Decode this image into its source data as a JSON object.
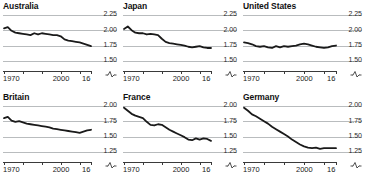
{
  "chart_data": {
    "type": "line",
    "title": "",
    "xlabel": "",
    "ylabel": "",
    "grid": true,
    "legend_position": "none",
    "x_axis": {
      "start": 1970,
      "end": 2016,
      "tick_labels": [
        "1970",
        "2000",
        "16"
      ],
      "tick_label_years": [
        1970,
        2000,
        2016
      ],
      "minor_tick_years": [
        1970,
        1980,
        1990,
        2000,
        2010,
        2016
      ],
      "axis_break_symbol": "~"
    },
    "panels": [
      {
        "title": "Australia",
        "ylim": [
          1.4,
          2.28
        ],
        "yticks": [
          2.25,
          2.0,
          1.75,
          1.5
        ],
        "ytick_labels": [
          "2.25",
          "2.00",
          "1.75",
          "1.50"
        ],
        "x": [
          1970,
          1972,
          1974,
          1976,
          1978,
          1980,
          1982,
          1984,
          1986,
          1988,
          1990,
          1992,
          1994,
          1996,
          1998,
          2000,
          2002,
          2004,
          2006,
          2008,
          2010,
          2012,
          2014,
          2016
        ],
        "values": [
          2.03,
          2.05,
          1.99,
          1.96,
          1.95,
          1.94,
          1.93,
          1.92,
          1.95,
          1.93,
          1.95,
          1.94,
          1.93,
          1.92,
          1.92,
          1.9,
          1.85,
          1.83,
          1.82,
          1.81,
          1.8,
          1.78,
          1.76,
          1.74
        ]
      },
      {
        "title": "Japan",
        "ylim": [
          1.4,
          2.28
        ],
        "yticks": [
          2.25,
          2.0,
          1.75,
          1.5
        ],
        "ytick_labels": [
          "2.25",
          "2.00",
          "1.75",
          "1.50"
        ],
        "x": [
          1970,
          1972,
          1974,
          1976,
          1978,
          1980,
          1982,
          1984,
          1986,
          1988,
          1990,
          1992,
          1994,
          1996,
          1998,
          2000,
          2002,
          2004,
          2006,
          2008,
          2010,
          2012,
          2014,
          2016
        ],
        "values": [
          2.02,
          2.06,
          2.0,
          1.96,
          1.95,
          1.95,
          1.93,
          1.94,
          1.93,
          1.92,
          1.86,
          1.81,
          1.79,
          1.78,
          1.77,
          1.76,
          1.75,
          1.73,
          1.72,
          1.73,
          1.74,
          1.72,
          1.71,
          1.71
        ]
      },
      {
        "title": "United States",
        "ylim": [
          1.4,
          2.28
        ],
        "yticks": [
          2.25,
          2.0,
          1.75,
          1.5
        ],
        "ytick_labels": [
          "2.25",
          "2.00",
          "1.75",
          "1.50"
        ],
        "x": [
          1970,
          1972,
          1974,
          1976,
          1978,
          1980,
          1982,
          1984,
          1986,
          1988,
          1990,
          1992,
          1994,
          1996,
          1998,
          2000,
          2002,
          2004,
          2006,
          2008,
          2010,
          2012,
          2014,
          2016
        ],
        "values": [
          1.8,
          1.79,
          1.77,
          1.74,
          1.73,
          1.74,
          1.72,
          1.71,
          1.74,
          1.72,
          1.74,
          1.73,
          1.74,
          1.75,
          1.77,
          1.78,
          1.77,
          1.75,
          1.73,
          1.72,
          1.71,
          1.72,
          1.74,
          1.75
        ]
      },
      {
        "title": "Britain",
        "ylim": [
          1.15,
          2.03
        ],
        "yticks": [
          2.0,
          1.75,
          1.5,
          1.25
        ],
        "ytick_labels": [
          "2.00",
          "1.75",
          "1.50",
          "1.25"
        ],
        "x": [
          1970,
          1972,
          1974,
          1976,
          1978,
          1980,
          1982,
          1984,
          1986,
          1988,
          1990,
          1992,
          1994,
          1996,
          1998,
          2000,
          2002,
          2004,
          2006,
          2008,
          2010,
          2012,
          2014,
          2016
        ],
        "values": [
          1.8,
          1.82,
          1.76,
          1.74,
          1.75,
          1.73,
          1.71,
          1.7,
          1.69,
          1.68,
          1.67,
          1.66,
          1.65,
          1.63,
          1.62,
          1.61,
          1.6,
          1.59,
          1.58,
          1.57,
          1.56,
          1.58,
          1.6,
          1.61
        ]
      },
      {
        "title": "France",
        "ylim": [
          1.15,
          2.03
        ],
        "yticks": [
          2.0,
          1.75,
          1.5,
          1.25
        ],
        "ytick_labels": [
          "2.00",
          "1.75",
          "1.50",
          "1.25"
        ],
        "x": [
          1970,
          1972,
          1974,
          1976,
          1978,
          1980,
          1982,
          1984,
          1986,
          1988,
          1990,
          1992,
          1994,
          1996,
          1998,
          2000,
          2002,
          2004,
          2006,
          2008,
          2010,
          2012,
          2014,
          2016
        ],
        "values": [
          1.97,
          1.92,
          1.87,
          1.84,
          1.82,
          1.8,
          1.74,
          1.69,
          1.68,
          1.7,
          1.69,
          1.65,
          1.61,
          1.58,
          1.55,
          1.52,
          1.49,
          1.45,
          1.44,
          1.47,
          1.45,
          1.47,
          1.46,
          1.43
        ]
      },
      {
        "title": "Germany",
        "ylim": [
          1.15,
          2.03
        ],
        "yticks": [
          2.0,
          1.75,
          1.5,
          1.25
        ],
        "ytick_labels": [
          "2.00",
          "1.75",
          "1.50",
          "1.25"
        ],
        "x": [
          1970,
          1972,
          1974,
          1976,
          1978,
          1980,
          1982,
          1984,
          1986,
          1988,
          1990,
          1992,
          1994,
          1996,
          1998,
          2000,
          2002,
          2004,
          2006,
          2008,
          2010,
          2012,
          2014,
          2016
        ],
        "values": [
          1.97,
          1.92,
          1.86,
          1.83,
          1.79,
          1.75,
          1.71,
          1.66,
          1.62,
          1.58,
          1.54,
          1.5,
          1.45,
          1.41,
          1.37,
          1.34,
          1.32,
          1.31,
          1.32,
          1.3,
          1.31,
          1.31,
          1.31,
          1.31
        ]
      }
    ]
  },
  "colors": {
    "line": "#1a1a1a",
    "gridline": "#b9bcbe",
    "axis": "#3a3a3a",
    "text": "#111111",
    "background": "#ffffff"
  }
}
